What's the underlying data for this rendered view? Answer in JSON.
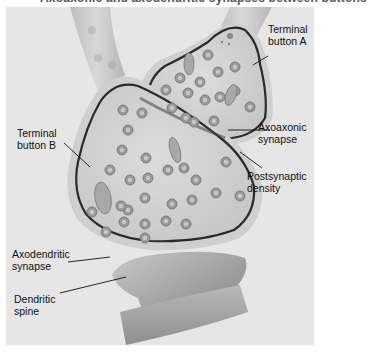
{
  "caption": {
    "top_fragment": "Axoaxonic and axodendritic synapses between buttons"
  },
  "labels": {
    "terminal_button_a": [
      "Terminal",
      "button A"
    ],
    "axoaxonic_synapse": [
      "Axoaxonic",
      "synapse"
    ],
    "postsynaptic_density": [
      "Postsynaptic",
      "density"
    ],
    "terminal_button_b": [
      "Terminal",
      "button B"
    ],
    "axodendritic_synapse": [
      "Axodendritic",
      "synapse"
    ],
    "dendritic_spine": [
      "Dendritic",
      "spine"
    ]
  },
  "colors": {
    "background": "#e6e6e6",
    "axon_fill": "#c9c9c9",
    "bouton_fill": "#d4d4d4",
    "membrane": "#2a2a2a",
    "vesicle": "#8a8a8a",
    "spine": "#a8a8a8"
  }
}
